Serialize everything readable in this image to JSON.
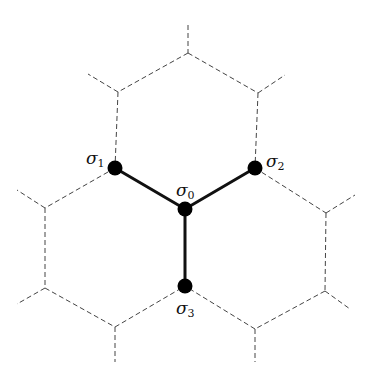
{
  "diagram": {
    "colors": {
      "background": "#ffffff",
      "lattice": "#444444",
      "bonds": "#111111",
      "nodes": "#000000"
    },
    "nodes": [
      {
        "id": "s0",
        "label": "σ",
        "sub": "0",
        "x": 185,
        "y": 209
      },
      {
        "id": "s1",
        "label": "σ",
        "sub": "1",
        "x": 115,
        "y": 168
      },
      {
        "id": "s2",
        "label": "σ",
        "sub": "2",
        "x": 255,
        "y": 168
      },
      {
        "id": "s3",
        "label": "σ",
        "sub": "3",
        "x": 185,
        "y": 286
      }
    ],
    "bonds": [
      [
        "s0",
        "s1"
      ],
      [
        "s0",
        "s2"
      ],
      [
        "s0",
        "s3"
      ]
    ],
    "lattice_style": "dashed"
  }
}
